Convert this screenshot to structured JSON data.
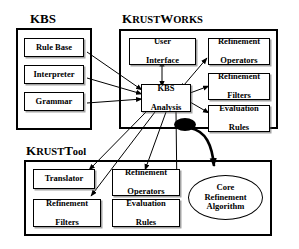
{
  "diagram": {
    "background_color": "#ffffff",
    "line_color": "#000000",
    "groups": [
      {
        "id": "kbs",
        "label": "KBS",
        "label_caps": "KBS",
        "label_rest": "",
        "nodes": [
          {
            "id": "rule-base",
            "label": "Rule Base"
          },
          {
            "id": "interpreter",
            "label": "Interpreter"
          },
          {
            "id": "grammar",
            "label": "Grammar"
          }
        ]
      },
      {
        "id": "krustworks",
        "label": "KrustWorks",
        "label_caps": "K",
        "label_rest": "RUST",
        "label_caps2": "W",
        "label_rest2": "ORKS",
        "nodes": [
          {
            "id": "user-interface",
            "line1": "User",
            "line2": "Interface"
          },
          {
            "id": "refinement-operators",
            "line1": "Refinement",
            "line2": "Operators"
          },
          {
            "id": "kbs-analysis",
            "line1": "KBS",
            "line2": "Analysis"
          },
          {
            "id": "refinement-filters",
            "line1": "Refinement",
            "line2": "Filters"
          },
          {
            "id": "evaluation-rules",
            "line1": "Evaluation",
            "line2": "Rules"
          }
        ]
      },
      {
        "id": "krusttool",
        "label": "KrustTool",
        "label_caps": "K",
        "label_rest": "RUST",
        "label_caps2": "T",
        "label_rest2": "ool",
        "nodes": [
          {
            "id": "translator",
            "line1": "Translator",
            "line2": ""
          },
          {
            "id": "tool-refinement-operators",
            "line1": "Refinement",
            "line2": "Operators"
          },
          {
            "id": "tool-refinement-filters",
            "line1": "Refinement",
            "line2": "Filters"
          },
          {
            "id": "tool-evaluation-rules",
            "line1": "Evaluation",
            "line2": "Rules"
          },
          {
            "id": "core-refinement-algorithm",
            "line1": "Core",
            "line2": "Refinement",
            "line3": "Algorithm"
          }
        ]
      }
    ]
  }
}
